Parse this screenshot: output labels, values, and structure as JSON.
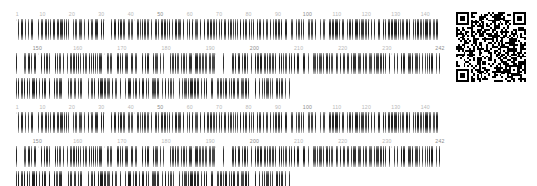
{
  "document": {
    "type": "barcode-sheet",
    "background_color": "#ffffff",
    "bar_color": "#2a2a2a",
    "label_color": "#b9b9b9",
    "label_color_major": "#8d8d8d"
  },
  "blocks": [
    {
      "name": "block-1",
      "ruler_top": {
        "labels": [
          "1",
          "10",
          "20",
          "30",
          "40",
          "50",
          "60",
          "70",
          "80",
          "90",
          "100",
          "110",
          "120",
          "130",
          "140"
        ],
        "values": [
          1,
          10,
          20,
          30,
          40,
          50,
          60,
          70,
          80,
          90,
          100,
          110,
          120,
          130,
          140
        ],
        "range_start": 1,
        "range_end": 145
      },
      "ruler_bottom": {
        "labels": [
          "150",
          "160",
          "170",
          "180",
          "190",
          "200",
          "210",
          "220",
          "230",
          "242"
        ],
        "values": [
          150,
          160,
          170,
          180,
          190,
          200,
          210,
          220,
          230,
          242
        ],
        "range_start": 146,
        "range_end": 242
      },
      "continuation_row": {
        "label": "",
        "width_percent": 64.6
      },
      "qr": {
        "name": "qr-code",
        "size_px": 70,
        "modules": 37
      }
    },
    {
      "name": "block-2",
      "ruler_top": {
        "labels": [
          "1",
          "10",
          "20",
          "30",
          "40",
          "50",
          "60",
          "70",
          "80",
          "90",
          "100",
          "110",
          "120",
          "130",
          "140"
        ],
        "values": [
          1,
          10,
          20,
          30,
          40,
          50,
          60,
          70,
          80,
          90,
          100,
          110,
          120,
          130,
          140
        ],
        "range_start": 1,
        "range_end": 145
      },
      "ruler_bottom": {
        "labels": [
          "150",
          "160",
          "170",
          "180",
          "190",
          "200",
          "210",
          "220",
          "230",
          "242"
        ],
        "values": [
          150,
          160,
          170,
          180,
          190,
          200,
          210,
          220,
          230,
          242
        ],
        "range_start": 146,
        "range_end": 242
      },
      "continuation_row": {
        "label": "",
        "width_percent": 64.6
      },
      "qr": {
        "name": "qr-code",
        "size_px": 70,
        "modules": 37
      }
    }
  ]
}
